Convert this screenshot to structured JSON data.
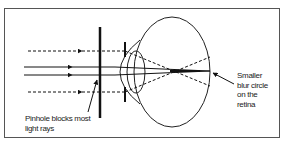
{
  "diagram": {
    "labels": {
      "pinhole_line1": "Pinhole blocks most",
      "pinhole_line2": "light rays",
      "retina_line1": "Smaller",
      "retina_line2": "blur circle",
      "retina_line3": "on the",
      "retina_line4": "retina"
    },
    "elements": [
      "pinhole barrier",
      "eyeball",
      "cornea",
      "iris",
      "lens",
      "solid light rays",
      "dashed light rays",
      "focal convergence point"
    ],
    "colors": {
      "line": "#111111",
      "frame": "#555555",
      "background": "#ffffff"
    }
  }
}
